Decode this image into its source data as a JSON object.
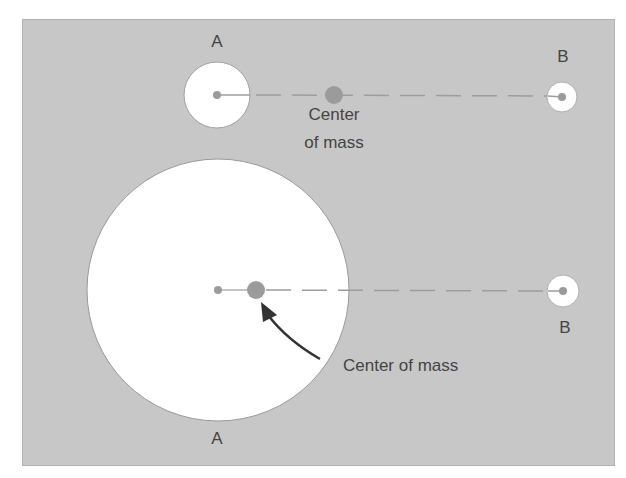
{
  "diagram": {
    "colors": {
      "background": "#c7c7c7",
      "body_fill": "#ffffff",
      "body_stroke": "#9a9a9a",
      "center_dot": "#9b9b9b",
      "line": "#9d9d9d",
      "arrow": "#333333",
      "text": "#444444"
    },
    "top_system": {
      "body_a": {
        "label": "A",
        "cx": 217,
        "cy": 95,
        "r": 33
      },
      "body_b": {
        "label": "B",
        "cx": 562,
        "cy": 97,
        "r": 15
      },
      "center_of_mass": {
        "label_line1": "Center",
        "label_line2": "of mass",
        "cx": 334,
        "cy": 95,
        "r": 9
      }
    },
    "bottom_system": {
      "body_a": {
        "label": "A",
        "cx": 218,
        "cy": 290,
        "r": 131
      },
      "body_b": {
        "label": "B",
        "cx": 563,
        "cy": 291,
        "r": 16
      },
      "center_of_mass": {
        "label": "Center of mass",
        "cx": 256,
        "cy": 290,
        "r": 9
      },
      "arrow": {
        "from": [
          320,
          359
        ],
        "to": [
          261,
          303
        ]
      }
    }
  }
}
